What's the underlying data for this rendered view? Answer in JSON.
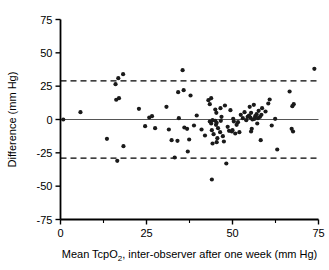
{
  "chart_data": {
    "type": "scatter",
    "title": "",
    "xlabel": "Mean TcpO2, inter-observer after one week (mm Hg)",
    "xlabel_prefix": "Mean TcpO",
    "xlabel_subscript": "2",
    "xlabel_suffix": ", inter-observer after one week (mm Hg)",
    "ylabel": "Difference (mm Hg)",
    "xlim": [
      0,
      75
    ],
    "ylim": [
      -75,
      75
    ],
    "xticks": [
      0,
      25,
      50,
      75
    ],
    "xtick_labels": [
      "0",
      "25",
      "50",
      "75"
    ],
    "xminorticks": [
      12.5,
      37.5,
      62.5
    ],
    "yticks": [
      75,
      50,
      25,
      0,
      -25,
      -50,
      -75
    ],
    "ytick_labels": [
      "75",
      "50",
      "25",
      "0",
      "-25",
      "-50",
      "-75"
    ],
    "grid": false,
    "legend": "none",
    "reference_lines": [
      {
        "name": "mean-bias-line",
        "y": 0,
        "style": "solid",
        "color": "#555555"
      },
      {
        "name": "upper-limit-of-agreement",
        "y": 29,
        "style": "dashed",
        "color": "#000000"
      },
      {
        "name": "lower-limit-of-agreement",
        "y": -29,
        "style": "dashed",
        "color": "#000000"
      }
    ],
    "marker": {
      "shape": "circle",
      "color": "#1a1a1a",
      "radius": 2.1
    },
    "points": [
      [
        0.8,
        0.0
      ],
      [
        5.8,
        5.5
      ],
      [
        13.5,
        -14.5
      ],
      [
        16.0,
        26.5
      ],
      [
        16.2,
        14.8
      ],
      [
        17.0,
        16.0
      ],
      [
        16.8,
        31.0
      ],
      [
        18.2,
        34.0
      ],
      [
        16.5,
        -31.0
      ],
      [
        18.3,
        -20.0
      ],
      [
        22.8,
        8.0
      ],
      [
        24.6,
        -5.0
      ],
      [
        25.8,
        1.5
      ],
      [
        26.6,
        2.5
      ],
      [
        27.5,
        -6.5
      ],
      [
        30.8,
        9.5
      ],
      [
        31.5,
        -7.5
      ],
      [
        32.3,
        -15.5
      ],
      [
        33.2,
        -28.5
      ],
      [
        34.2,
        20.5
      ],
      [
        34.4,
        1.0
      ],
      [
        34.0,
        -16.0
      ],
      [
        35.8,
        22.0
      ],
      [
        35.5,
        37.0
      ],
      [
        36.0,
        -6.0
      ],
      [
        36.8,
        -7.0
      ],
      [
        37.4,
        -15.0
      ],
      [
        37.8,
        18.0
      ],
      [
        37.0,
        -24.0
      ],
      [
        38.8,
        -4.5
      ],
      [
        39.6,
        3.0
      ],
      [
        41.0,
        -7.5
      ],
      [
        42.0,
        -12.0
      ],
      [
        43.0,
        14.5
      ],
      [
        43.4,
        11.5
      ],
      [
        43.8,
        16.0
      ],
      [
        43.4,
        -1.5
      ],
      [
        43.8,
        -3.0
      ],
      [
        44.2,
        -0.5
      ],
      [
        44.0,
        -8.0
      ],
      [
        44.5,
        -11.0
      ],
      [
        44.2,
        -18.0
      ],
      [
        44.0,
        -45.0
      ],
      [
        45.0,
        7.5
      ],
      [
        45.3,
        5.0
      ],
      [
        45.0,
        -1.0
      ],
      [
        45.4,
        -2.5
      ],
      [
        45.2,
        -4.0
      ],
      [
        45.8,
        -6.5
      ],
      [
        45.6,
        -14.0
      ],
      [
        45.4,
        -17.0
      ],
      [
        46.5,
        8.5
      ],
      [
        46.8,
        2.0
      ],
      [
        46.6,
        -1.0
      ],
      [
        46.4,
        -9.5
      ],
      [
        47.2,
        -12.5
      ],
      [
        47.5,
        -16.5
      ],
      [
        47.8,
        10.5
      ],
      [
        48.2,
        -33.0
      ],
      [
        48.6,
        -5.5
      ],
      [
        49.0,
        -8.5
      ],
      [
        49.4,
        7.0
      ],
      [
        49.8,
        -9.0
      ],
      [
        50.2,
        0.5
      ],
      [
        50.4,
        -1.5
      ],
      [
        50.0,
        -8.0
      ],
      [
        50.8,
        -10.5
      ],
      [
        51.2,
        -4.0
      ],
      [
        51.6,
        -2.0
      ],
      [
        52.0,
        -9.5
      ],
      [
        52.4,
        3.5
      ],
      [
        53.0,
        1.0
      ],
      [
        53.5,
        5.5
      ],
      [
        54.0,
        -0.5
      ],
      [
        54.4,
        2.0
      ],
      [
        54.8,
        3.0
      ],
      [
        55.0,
        9.5
      ],
      [
        55.4,
        5.0
      ],
      [
        55.2,
        1.5
      ],
      [
        55.8,
        0.0
      ],
      [
        55.6,
        -7.0
      ],
      [
        55.4,
        -9.0
      ],
      [
        56.2,
        11.0
      ],
      [
        56.6,
        2.5
      ],
      [
        56.4,
        0.5
      ],
      [
        57.0,
        4.0
      ],
      [
        57.4,
        1.0
      ],
      [
        57.6,
        6.5
      ],
      [
        57.2,
        -3.0
      ],
      [
        58.0,
        2.0
      ],
      [
        58.4,
        3.5
      ],
      [
        58.6,
        8.5
      ],
      [
        58.2,
        -15.5
      ],
      [
        59.6,
        6.0
      ],
      [
        60.4,
        12.0
      ],
      [
        60.8,
        15.0
      ],
      [
        61.4,
        -4.5
      ],
      [
        62.4,
        0.5
      ],
      [
        63.0,
        -22.5
      ],
      [
        66.6,
        21.0
      ],
      [
        67.4,
        10.0
      ],
      [
        67.8,
        11.5
      ],
      [
        67.2,
        -7.0
      ],
      [
        67.6,
        -9.0
      ],
      [
        73.8,
        38.0
      ]
    ],
    "n_points": 105
  },
  "axes": {
    "y_axis_name": "difference-axis",
    "x_axis_name": "mean-tcpo2-axis"
  }
}
